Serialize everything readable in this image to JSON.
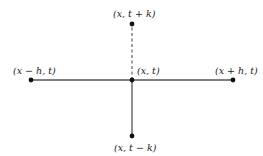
{
  "diagram": {
    "type": "finite-difference-stencil",
    "center": {
      "label": "(x, t)",
      "x": 132,
      "y": 80
    },
    "points": [
      {
        "id": "top",
        "label": "(x, t + k)",
        "x": 132,
        "y": 24,
        "connector": "dashed"
      },
      {
        "id": "left",
        "label": "(x − h, t)",
        "x": 31,
        "y": 80,
        "connector": "solid"
      },
      {
        "id": "right",
        "label": "(x + h, t)",
        "x": 233,
        "y": 80,
        "connector": "solid"
      },
      {
        "id": "bottom",
        "label": "(x, t − k)",
        "x": 132,
        "y": 136,
        "connector": "solid"
      }
    ],
    "colors": {
      "line": "#555555",
      "point": "#111111",
      "text": "#1a1a1a"
    }
  }
}
